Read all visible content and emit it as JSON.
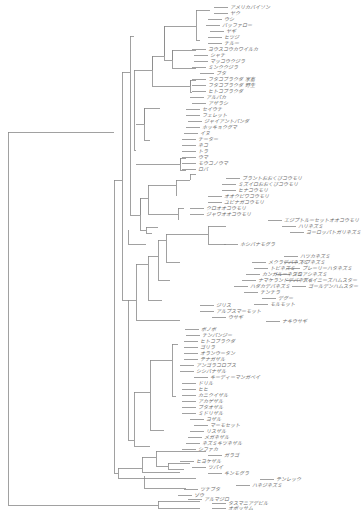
{
  "diagram": {
    "type": "phylogenetic-tree",
    "leaves": [
      {
        "label": "アメリカバイソン",
        "x": 228,
        "y": 7
      },
      {
        "label": "ヤク",
        "x": 228,
        "y": 13
      },
      {
        "label": "ウシ",
        "x": 222,
        "y": 19
      },
      {
        "label": "バッファロー",
        "x": 220,
        "y": 25
      },
      {
        "label": "ヤギ",
        "x": 224,
        "y": 31
      },
      {
        "label": "ヒツジ",
        "x": 222,
        "y": 37
      },
      {
        "label": "チルー",
        "x": 222,
        "y": 43
      },
      {
        "label": "ヨウスコウカワイルカ",
        "x": 206,
        "y": 49
      },
      {
        "label": "シャチ",
        "x": 208,
        "y": 55
      },
      {
        "label": "マッコウクジラ",
        "x": 208,
        "y": 61
      },
      {
        "label": "ミンククジラ",
        "x": 206,
        "y": 67
      },
      {
        "label": "ブタ",
        "x": 214,
        "y": 73
      },
      {
        "label": "フタコブラクダ 家畜",
        "x": 206,
        "y": 79
      },
      {
        "label": "フタコブラクダ 野生",
        "x": 206,
        "y": 85
      },
      {
        "label": "ヒトコブラクダ",
        "x": 206,
        "y": 91
      },
      {
        "label": "アルパカ",
        "x": 204,
        "y": 97
      },
      {
        "label": "アザラシ",
        "x": 206,
        "y": 103
      },
      {
        "label": "セイウチ",
        "x": 200,
        "y": 109
      },
      {
        "label": "フェレット",
        "x": 200,
        "y": 115
      },
      {
        "label": "ジャイアントパンダ",
        "x": 202,
        "y": 121
      },
      {
        "label": "ホッキョクグマ",
        "x": 200,
        "y": 127
      },
      {
        "label": "イヌ",
        "x": 198,
        "y": 133
      },
      {
        "label": "チーター",
        "x": 196,
        "y": 139
      },
      {
        "label": "ネコ",
        "x": 196,
        "y": 145
      },
      {
        "label": "トラ",
        "x": 196,
        "y": 151
      },
      {
        "label": "ウマ",
        "x": 196,
        "y": 157
      },
      {
        "label": "モウコノウマ",
        "x": 196,
        "y": 163
      },
      {
        "label": "ロバ",
        "x": 196,
        "y": 169
      },
      {
        "label": "ブラントおおくびコウモリ",
        "x": 240,
        "y": 178
      },
      {
        "label": "ミズイロおおくびコウモリ",
        "x": 236,
        "y": 184
      },
      {
        "label": "ヒナコウモリ",
        "x": 236,
        "y": 190
      },
      {
        "label": "オオクビワコウモリ",
        "x": 222,
        "y": 196
      },
      {
        "label": "ユビナガコウモリ",
        "x": 222,
        "y": 202
      },
      {
        "label": "クロオオコウモリ",
        "x": 204,
        "y": 208
      },
      {
        "label": "ジャワオオコウモリ",
        "x": 204,
        "y": 214
      },
      {
        "label": "エジプトルーセットオオコウモリ",
        "x": 282,
        "y": 220
      },
      {
        "label": "ハリネズミ",
        "x": 296,
        "y": 226
      },
      {
        "label": "ヨーロッパトガリネズミ",
        "x": 304,
        "y": 232
      },
      {
        "label": "ホシバナモグラ",
        "x": 238,
        "y": 244
      },
      {
        "label": "ハツカネズミ",
        "x": 298,
        "y": 256
      },
      {
        "label": "ドブネズミ",
        "x": 298,
        "y": 262
      },
      {
        "label": "プレーリーハタネズミ",
        "x": 300,
        "y": 268
      },
      {
        "label": "シロアシネズミ",
        "x": 290,
        "y": 274
      },
      {
        "label": "チャイニーズハムスター",
        "x": 300,
        "y": 280
      },
      {
        "label": "ゴールデンハムスター",
        "x": 306,
        "y": 286
      },
      {
        "label": "メクラデバネズミ",
        "x": 266,
        "y": 262
      },
      {
        "label": "トビネズミ",
        "x": 268,
        "y": 268
      },
      {
        "label": "カンガルーネズミ",
        "x": 260,
        "y": 274
      },
      {
        "label": "ナマケランドデバネズミ",
        "x": 256,
        "y": 280
      },
      {
        "label": "ハダカデバネズミ",
        "x": 248,
        "y": 286
      },
      {
        "label": "チンチラ",
        "x": 258,
        "y": 292
      },
      {
        "label": "デグー",
        "x": 276,
        "y": 298
      },
      {
        "label": "モルモット",
        "x": 268,
        "y": 304
      },
      {
        "label": "ジリス",
        "x": 214,
        "y": 305
      },
      {
        "label": "アルプスマーモット",
        "x": 214,
        "y": 311
      },
      {
        "label": "ウサギ",
        "x": 226,
        "y": 317
      },
      {
        "label": "ナキウサギ",
        "x": 280,
        "y": 321
      },
      {
        "label": "ボノボ",
        "x": 199,
        "y": 329
      },
      {
        "label": "チンパンジー",
        "x": 200,
        "y": 335
      },
      {
        "label": "ヒトコブラクダ_p",
        "x": 198,
        "y": 341
      },
      {
        "label": "ゴリラ",
        "x": 198,
        "y": 347
      },
      {
        "label": "オランウータン",
        "x": 198,
        "y": 353
      },
      {
        "label": "テナガザル",
        "x": 198,
        "y": 359
      },
      {
        "label": "アンゴラコロブス",
        "x": 194,
        "y": 365
      },
      {
        "label": "シシバナザル",
        "x": 194,
        "y": 371
      },
      {
        "label": "キーディーマンガベイ",
        "x": 208,
        "y": 377
      },
      {
        "label": "ドリル",
        "x": 196,
        "y": 383
      },
      {
        "label": "ヒヒ",
        "x": 196,
        "y": 389
      },
      {
        "label": "カニクイザル",
        "x": 196,
        "y": 395
      },
      {
        "label": "アカゲザル",
        "x": 196,
        "y": 401
      },
      {
        "label": "ブタオザル",
        "x": 196,
        "y": 407
      },
      {
        "label": "ミドリザル",
        "x": 196,
        "y": 413
      },
      {
        "label": "ヨザル",
        "x": 204,
        "y": 419
      },
      {
        "label": "マーモセット",
        "x": 208,
        "y": 425
      },
      {
        "label": "リスザル",
        "x": 204,
        "y": 431
      },
      {
        "label": "メガネザル",
        "x": 202,
        "y": 437
      },
      {
        "label": "ネズミキツネザル",
        "x": 200,
        "y": 443
      },
      {
        "label": "シファカ",
        "x": 196,
        "y": 449
      },
      {
        "label": "ガラゴ",
        "x": 222,
        "y": 455
      },
      {
        "label": "ヒヨケザル",
        "x": 194,
        "y": 461
      },
      {
        "label": "ツパイ",
        "x": 206,
        "y": 467
      },
      {
        "label": "キンモグラ",
        "x": 222,
        "y": 473
      },
      {
        "label": "テンレック",
        "x": 274,
        "y": 479
      },
      {
        "label": "ハネジネズミ",
        "x": 250,
        "y": 485
      },
      {
        "label": "ツチブタ",
        "x": 198,
        "y": 489
      },
      {
        "label": "ゾウ",
        "x": 192,
        "y": 495
      },
      {
        "label": "アルマジロ",
        "x": 202,
        "y": 499
      },
      {
        "label": "タスマニアデビル",
        "x": 226,
        "y": 503
      },
      {
        "label": "オポッサム",
        "x": 226,
        "y": 508
      }
    ],
    "display_labels": {
      "ヒトコブラクダ_p": "ヒトコブラクダ"
    }
  },
  "colors": {
    "line": "#8a8a8a",
    "text": "#6a6a6a",
    "background": "#ffffff"
  }
}
